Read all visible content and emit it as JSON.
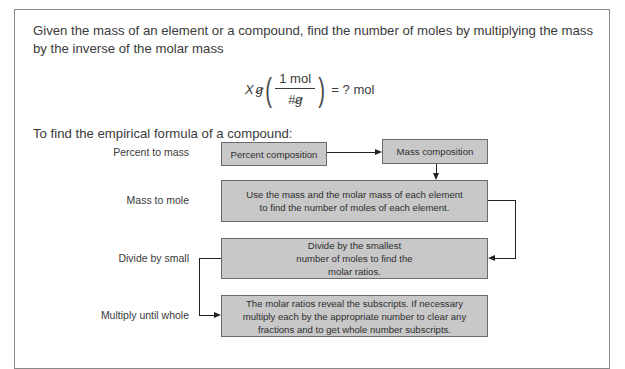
{
  "intro": {
    "text": "Given the mass of an element or a compound, find the number of moles by multiplying the mass by the inverse of the molar mass"
  },
  "equation": {
    "left_var": "X",
    "left_unit": "g",
    "numerator": "1 mol",
    "denominator_var": "#",
    "denominator_unit": "g",
    "result": "= ? mol"
  },
  "flowchart": {
    "title": "To find the empirical formula of a compound:",
    "colors": {
      "box_fill": "#c8c8c8",
      "box_border": "#6a6a6a",
      "connector": "#222222"
    },
    "steps": [
      {
        "label": "Percent to mass"
      },
      {
        "label": "Mass to mole"
      },
      {
        "label": "Divide by small"
      },
      {
        "label": "Multiply until whole"
      }
    ],
    "boxes": [
      {
        "text": "Percent composition"
      },
      {
        "text": "Mass composition"
      },
      {
        "text": "Use the mass and the molar mass of each element to find the number of moles of each element."
      },
      {
        "text": "Divide by the smallest number of moles to find the molar ratios."
      },
      {
        "text": "The molar ratios reveal the subscripts. If necessary multiply each by the appropriate number to clear any fractions and to get whole number subscripts."
      }
    ]
  }
}
